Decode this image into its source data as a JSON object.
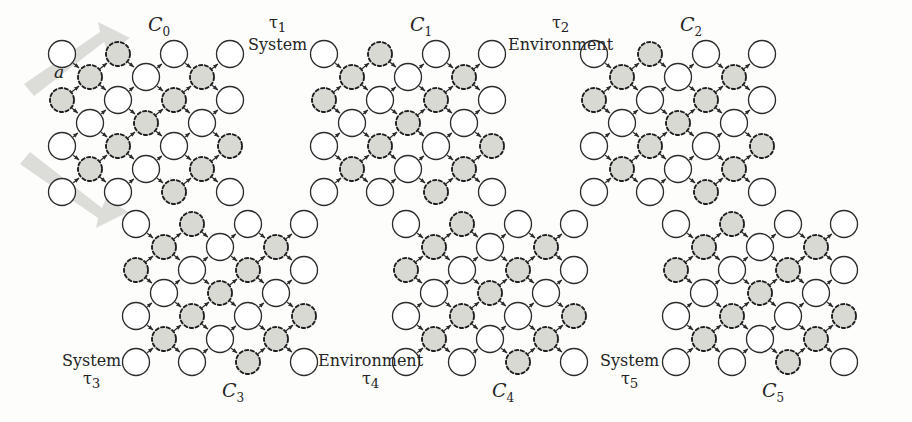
{
  "figure": {
    "background": "#fdfdfc",
    "node_plain_fill": "#ffffff",
    "node_shaded_fill": "#d9d9d4",
    "edge_color": "#2b2b2b",
    "fat_arrow_color": "#dcdcd8"
  },
  "flow_arrows": [
    {
      "label": "a",
      "direction": "up-right",
      "x": 22,
      "y": 22,
      "w": 108,
      "h": 74,
      "label_x": 54,
      "label_y": 63
    },
    {
      "label": "d",
      "direction": "down-right",
      "x": 18,
      "y": 152,
      "w": 110,
      "h": 76,
      "label_x": 50,
      "label_y": 177
    }
  ],
  "panels": [
    {
      "id": "C0",
      "caption": "C",
      "caption_sub": "0",
      "caption_x": 148,
      "caption_y": 14,
      "origin_x": 40,
      "origin_y": 32,
      "numbered_nodes": [
        {
          "value": "6",
          "col": 0,
          "row": 3,
          "style": "plain"
        }
      ]
    },
    {
      "id": "C1",
      "caption": "C",
      "caption_sub": "1",
      "caption_x": 410,
      "caption_y": 14,
      "origin_x": 302,
      "origin_y": 32,
      "numbered_nodes": [
        {
          "value": "6",
          "col": 0,
          "row": 3,
          "style": "plain"
        }
      ]
    },
    {
      "id": "C2",
      "caption": "C",
      "caption_sub": "2",
      "caption_x": 680,
      "caption_y": 14,
      "origin_x": 572,
      "origin_y": 32,
      "numbered_nodes": [
        {
          "value": "4",
          "col": 2,
          "row": 5,
          "style": "shaded"
        },
        {
          "value": "2",
          "col": 3,
          "row": 6,
          "style": "plain"
        }
      ]
    },
    {
      "id": "C3",
      "caption": "C",
      "caption_sub": "3",
      "caption_x": 222,
      "caption_y": 380,
      "origin_x": 114,
      "origin_y": 202,
      "numbered_nodes": [
        {
          "value": "4",
          "col": 4,
          "row": 3,
          "style": "plain"
        },
        {
          "value": "2",
          "col": 6,
          "row": 3,
          "style": "plain"
        }
      ]
    },
    {
      "id": "C4",
      "caption": "C",
      "caption_sub": "4",
      "caption_x": 492,
      "caption_y": 380,
      "origin_x": 384,
      "origin_y": 202,
      "numbered_nodes": [
        {
          "value": "4",
          "col": 5,
          "row": 4,
          "style": "shaded"
        },
        {
          "value": "2",
          "col": 6,
          "row": 3,
          "style": "plain"
        }
      ]
    },
    {
      "id": "C5",
      "caption": "C",
      "caption_sub": "5",
      "caption_x": 762,
      "caption_y": 380,
      "origin_x": 654,
      "origin_y": 202,
      "numbered_nodes": [
        {
          "value": "6",
          "col": 6,
          "row": 3,
          "style": "plain"
        }
      ]
    }
  ],
  "step_labels": [
    {
      "tau": "τ",
      "tau_sub": "1",
      "kind": "System",
      "order": "tau-first",
      "x": 248,
      "y": 14
    },
    {
      "tau": "τ",
      "tau_sub": "2",
      "kind": "Environment",
      "order": "tau-first",
      "x": 508,
      "y": 14
    },
    {
      "tau": "τ",
      "tau_sub": "3",
      "kind": "System",
      "order": "kind-first",
      "x": 62,
      "y": 352
    },
    {
      "tau": "τ",
      "tau_sub": "4",
      "kind": "Environment",
      "order": "kind-first",
      "x": 318,
      "y": 352
    },
    {
      "tau": "τ",
      "tau_sub": "5",
      "kind": "System",
      "order": "kind-first",
      "x": 600,
      "y": 352
    }
  ],
  "lattice_spec": {
    "cols": 7,
    "rows": 7,
    "dx": 28,
    "dy": 23,
    "radius_plain": 13.5,
    "radius_shaded": 12.0,
    "description": "Diamond grid; node exists where (col+row) is even and lies inside the rhombus; shaded nodes sit on the odd diagonal sublattice."
  }
}
